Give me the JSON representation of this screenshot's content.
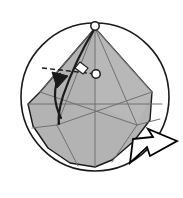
{
  "figure": {
    "canvas": {
      "width": 183,
      "height": 198
    },
    "colors": {
      "background": "#ffffff",
      "paper_shade": "#b3b3b3",
      "paper_highlight": "#c8c8c8",
      "outline": "#1a1a1a",
      "crease": "#707070",
      "arrow_fill": "#ffffff",
      "arrow_stroke": "#000000",
      "marker_fill": "#ffffff"
    },
    "circle": {
      "label": "paper-boundary-circle",
      "cx": 95,
      "cy": 97,
      "r": 74,
      "stroke_width": 1.6
    },
    "apex_marker": {
      "label": "apex-reference-point",
      "cx": 95,
      "cy": 26,
      "r": 4.2
    },
    "pivot_marker": {
      "label": "fold-pivot-point",
      "cx": 96,
      "cy": 74,
      "r": 4.2
    },
    "shaded_flap": {
      "label": "shaded-paper-flap",
      "points": "95,28 152,92 150,120 134,141 112,160 95,167 70,163 48,148 33,126 28,104 40,92"
    },
    "crease_lines": [
      {
        "name": "crease-apex-to-left-vertex",
        "x1": 95,
        "y1": 28,
        "x2": 40,
        "y2": 92
      },
      {
        "name": "crease-apex-to-right-vertex",
        "x1": 95,
        "y1": 28,
        "x2": 152,
        "y2": 92
      },
      {
        "name": "crease-apex-center-vertical",
        "x1": 95,
        "y1": 28,
        "x2": 95,
        "y2": 167
      },
      {
        "name": "crease-apex-to-left-node",
        "x1": 95,
        "y1": 28,
        "x2": 57,
        "y2": 125
      },
      {
        "name": "crease-apex-to-right-node",
        "x1": 95,
        "y1": 28,
        "x2": 137,
        "y2": 125
      },
      {
        "name": "crease-horizontal-band",
        "x1": 28,
        "y1": 104,
        "x2": 162,
        "y2": 104
      },
      {
        "name": "crease-left-diagonal-up",
        "x1": 40,
        "y1": 92,
        "x2": 137,
        "y2": 125
      },
      {
        "name": "crease-right-diagonal-up",
        "x1": 152,
        "y1": 92,
        "x2": 57,
        "y2": 125
      },
      {
        "name": "crease-left-node-to-bottom",
        "x1": 57,
        "y1": 125,
        "x2": 78,
        "y2": 166
      },
      {
        "name": "crease-right-node-to-bottom",
        "x1": 137,
        "y1": 125,
        "x2": 112,
        "y2": 162
      },
      {
        "name": "crease-left-node-to-lower-left",
        "x1": 57,
        "y1": 125,
        "x2": 32,
        "y2": 128
      },
      {
        "name": "crease-right-node-to-lower-right",
        "x1": 137,
        "y1": 125,
        "x2": 160,
        "y2": 119
      }
    ],
    "valley_fold_dashed_line": {
      "name": "valley-fold-dashed-line",
      "x1": 42,
      "y1": 68,
      "x2": 96,
      "y2": 74,
      "dash": "5,3"
    },
    "right_angle_marker": {
      "name": "right-angle-marker",
      "points": "80,62 88,68 83,74 75,68"
    },
    "fold_edge_curve": {
      "name": "fold-edge-curve",
      "path": "M95,28 C84,46 72,70 63,96 C58,112 58,118 59,124"
    },
    "rotation_arrow": {
      "name": "rotation-fold-arrow",
      "shaft": "M61,118 C53,102 53,88 60,74",
      "head": "52,72 68,76 57,88"
    },
    "turnover_arrow": {
      "name": "turn-over-arrow",
      "points": "133,139 153,137 148,129 177,141 150,156 147,147 130,163"
    },
    "labels": {
      "figure_caption": "",
      "step_number": ""
    }
  }
}
